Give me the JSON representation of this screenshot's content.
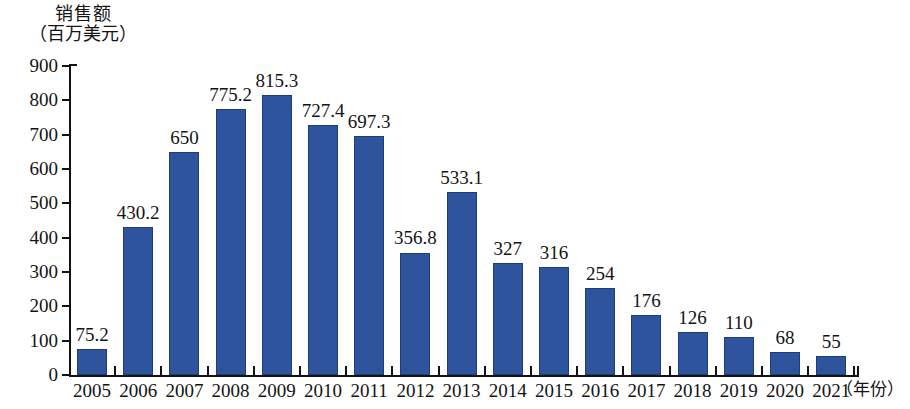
{
  "chart_data": {
    "type": "bar",
    "title": "销售额",
    "subtitle": "（百万美元）",
    "xlabel": "（年份）",
    "ylabel": "",
    "categories": [
      "2005",
      "2006",
      "2007",
      "2008",
      "2009",
      "2010",
      "2011",
      "2012",
      "2013",
      "2014",
      "2015",
      "2016",
      "2017",
      "2018",
      "2019",
      "2020",
      "2021"
    ],
    "values": [
      75.2,
      430.2,
      650,
      775.2,
      815.3,
      727.4,
      697.3,
      356.8,
      533.1,
      327,
      316,
      254,
      176,
      126,
      110,
      68,
      55
    ],
    "value_labels": [
      "75.2",
      "430.2",
      "650",
      "775.2",
      "815.3",
      "727.4",
      "697.3",
      "356.8",
      "533.1",
      "327",
      "316",
      "254",
      "176",
      "126",
      "110",
      "68",
      "55"
    ],
    "ylim": [
      0,
      900
    ],
    "ytick_values": [
      0,
      100,
      200,
      300,
      400,
      500,
      600,
      700,
      800,
      900
    ],
    "ytick_labels": [
      "0",
      "100",
      "200",
      "300",
      "400",
      "500",
      "600",
      "700",
      "800",
      "900"
    ],
    "grid": false,
    "legend": false,
    "series_color": "#2f549e",
    "bar_edge_color": "#1e3c79",
    "axis_color": "#121212"
  }
}
